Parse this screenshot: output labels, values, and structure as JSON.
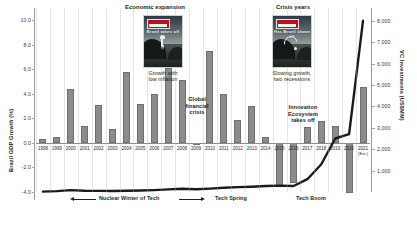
{
  "chart_data": {
    "type": "bar",
    "title": "",
    "categories": [
      "1998",
      "1999",
      "2000",
      "2001",
      "2002",
      "2003",
      "2004",
      "2005",
      "2006",
      "2007",
      "2008",
      "2009",
      "2010",
      "2011",
      "2012",
      "2013",
      "2014",
      "2015",
      "2016",
      "2017",
      "2018",
      "2019",
      "2020",
      "2021"
    ],
    "series": [
      {
        "name": "Brazil GDP Growth (%)",
        "type": "bar",
        "axis": "left",
        "color": "#8c8c8c",
        "values": [
          0.3,
          0.5,
          4.4,
          1.4,
          3.1,
          1.1,
          5.8,
          3.2,
          4.0,
          6.1,
          5.1,
          -0.1,
          7.5,
          4.0,
          1.9,
          3.0,
          0.5,
          -3.5,
          -3.3,
          1.3,
          1.8,
          1.4,
          -4.1,
          4.6
        ]
      },
      {
        "name": "VC Investments (US$MM)",
        "type": "line",
        "axis": "right",
        "color": "#1a1a1a",
        "values": [
          20,
          40,
          90,
          60,
          50,
          45,
          60,
          70,
          90,
          120,
          150,
          130,
          160,
          200,
          230,
          250,
          280,
          300,
          280,
          600,
          1300,
          2500,
          2700,
          8000
        ]
      }
    ],
    "xlabel": "",
    "ylabel": "Brazil GDP Growth (%)",
    "y2label": "VC Investments (US$MM)",
    "ylim": [
      -4.0,
      11.0
    ],
    "y2lim": [
      0,
      8600
    ],
    "grid": false,
    "legend": "none"
  },
  "axes": {
    "left": {
      "title": "Brazil GDP Growth (%)",
      "ticks": [
        "10.0",
        "8.0",
        "6.0",
        "4.0",
        "2.0",
        "0.0",
        "-2.0",
        "-4.0"
      ],
      "tick_values": [
        10,
        8,
        6,
        4,
        2,
        0,
        -2,
        -4
      ]
    },
    "right": {
      "title": "VC Investments (US$MM)",
      "ticks": [
        "8,000",
        "7,000",
        "6,000",
        "5,000",
        "4,000",
        "3,000",
        "2,000",
        "1,000"
      ],
      "tick_values": [
        8000,
        7000,
        6000,
        5000,
        4000,
        3000,
        2000,
        1000
      ]
    },
    "x": {
      "labels": [
        "1998",
        "1999",
        "2000",
        "2001",
        "2002",
        "2003",
        "2004",
        "2005",
        "2006",
        "2007",
        "2008",
        "2009",
        "2010",
        "2011",
        "2012",
        "2013",
        "2014",
        "2015",
        "2016",
        "2017",
        "2018",
        "2019",
        "2020",
        "2021"
      ],
      "last_label_note": "(Est.)"
    }
  },
  "annotations": {
    "economic_expansion": "Economic expansion",
    "crisis_years": "Crisis years",
    "growth_low_inflation": "Growth with\nlow inflation",
    "slowing_growth": "Slowing growth,\ntwo recessions",
    "global_financial_crisis": "Global\nfinancial\ncrisis",
    "innovation_ecosystem": "Innovation\nEcosystem\ntakes off"
  },
  "covers": {
    "left": {
      "masthead": "The Economist",
      "headline": "Brazil takes off",
      "caption": "Growth with\nlow inflation"
    },
    "right": {
      "masthead": "The Economist",
      "headline": "Has Brazil\nblown it?",
      "caption": "Slowing growth,\ntwo recessions"
    }
  },
  "eras": [
    {
      "label": "Nuclear Winter of Tech"
    },
    {
      "label": "Tech Spring"
    },
    {
      "label": "Tech Boom"
    }
  ]
}
